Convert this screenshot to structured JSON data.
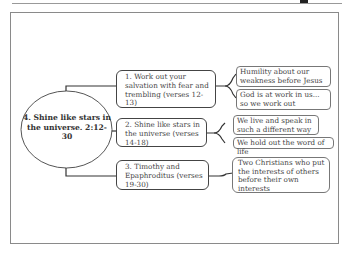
{
  "diagram": {
    "central": {
      "label": "4.  Shine like stars in the universe. 2:12-30"
    },
    "branches": [
      {
        "label": "1.  Work out your salvation with fear and trembling (verses 12-13)",
        "children": [
          "Humility about our weakness before Jesus",
          "God is at work in us... so we work out"
        ]
      },
      {
        "label": "2.  Shine like stars in the universe (verses 14-18)",
        "children": [
          "We live and speak in such a different way",
          "We hold out the word of life"
        ]
      },
      {
        "label": "3.  Timothy and Epaphroditus (verses 19-30)",
        "children": [
          "Two Christians who put the interests of others before their own interests"
        ]
      }
    ]
  }
}
